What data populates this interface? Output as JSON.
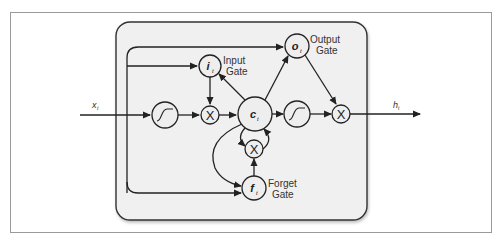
{
  "diagram": {
    "colors": {
      "frame": "#9a9a9a",
      "cell_fill": "#f0f0f0",
      "cell_border": "#333333",
      "node_fill": "#eeeeee",
      "line": "#222222"
    },
    "input": {
      "symbol": "x",
      "subscript": "t"
    },
    "output": {
      "symbol": "h",
      "subscript": "t"
    },
    "nodes": {
      "input_gate": {
        "symbol": "i",
        "subscript": "t",
        "label_line1": "Input",
        "label_line2": "Gate"
      },
      "output_gate": {
        "symbol": "o",
        "subscript": "t",
        "label_line1": "Output",
        "label_line2": "Gate"
      },
      "forget_gate": {
        "symbol": "f",
        "subscript": "t",
        "label_line1": "Forget",
        "label_line2": "Gate"
      },
      "cell_state": {
        "symbol": "c",
        "subscript": "t"
      },
      "input_activation": {
        "type": "sigmoid-curve"
      },
      "output_activation": {
        "type": "sigmoid-curve"
      },
      "input_multiply": {
        "symbol": "X"
      },
      "forget_multiply": {
        "symbol": "X"
      },
      "output_multiply": {
        "symbol": "X"
      }
    }
  }
}
